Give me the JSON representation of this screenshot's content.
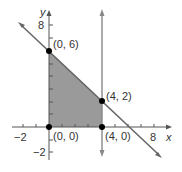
{
  "graph": {
    "axes": {
      "x_label": "x",
      "y_label": "y",
      "x_ticks": [
        "−2",
        "8"
      ],
      "y_ticks": [
        "8",
        "−2"
      ]
    },
    "region": {
      "fill": "#9a9a9a",
      "vertices": [
        "(0, 0)",
        "(0, 6)",
        "(4, 2)",
        "(4, 0)"
      ]
    },
    "points": [
      {
        "label": "(0, 6)"
      },
      {
        "label": "(4, 2)"
      },
      {
        "label": "(0, 0)"
      },
      {
        "label": "(4, 0)"
      }
    ],
    "lines": [
      {
        "equation": "x + y = 6",
        "color": "#666666"
      },
      {
        "equation": "x = 4",
        "color": "#888888"
      }
    ]
  }
}
